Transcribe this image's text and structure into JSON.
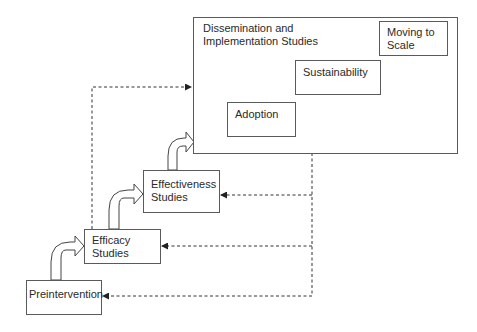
{
  "diagram": {
    "container": {
      "title": "Dissemination and\nImplementation Studies"
    },
    "stages": [
      {
        "id": "preintervention",
        "label": "Preintervention"
      },
      {
        "id": "efficacy",
        "label": "Efficacy\nStudies"
      },
      {
        "id": "effectiveness",
        "label": "Effectiveness\nStudies"
      }
    ],
    "inner_boxes": [
      {
        "id": "adoption",
        "label": "Adoption"
      },
      {
        "id": "sustainability",
        "label": "Sustainability"
      },
      {
        "id": "moving-to-scale",
        "label": "Moving to\nScale"
      }
    ],
    "flows": [
      {
        "from": "preintervention",
        "to": "efficacy",
        "style": "solid-curved-arrow"
      },
      {
        "from": "efficacy",
        "to": "effectiveness",
        "style": "solid-curved-arrow"
      },
      {
        "from": "effectiveness",
        "to": "dissemination",
        "style": "solid-curved-arrow"
      },
      {
        "from": "efficacy",
        "to": "dissemination",
        "style": "dashed-arrow"
      },
      {
        "from": "dissemination",
        "to": "effectiveness",
        "style": "dashed-arrow"
      },
      {
        "from": "dissemination",
        "to": "efficacy",
        "style": "dashed-arrow"
      },
      {
        "from": "dissemination",
        "to": "preintervention",
        "style": "dashed-arrow"
      }
    ]
  }
}
